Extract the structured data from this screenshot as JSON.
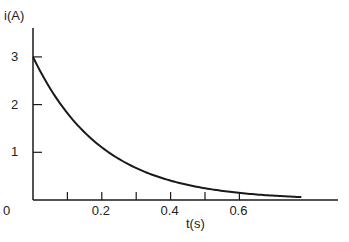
{
  "chart_data": {
    "type": "line",
    "title": "",
    "xlabel": "t(s)",
    "ylabel": "i(A)",
    "xlim": [
      0,
      0.9
    ],
    "ylim": [
      0,
      3.3
    ],
    "x_ticks": [
      0.1,
      0.2,
      0.3,
      0.4,
      0.5,
      0.6
    ],
    "x_tick_labels": [
      "0",
      "0.2",
      "0.4",
      "0.6"
    ],
    "x_tick_label_values": [
      0,
      0.2,
      0.4,
      0.6
    ],
    "y_ticks": [
      1,
      2,
      3
    ],
    "y_tick_labels": [
      "1",
      "2",
      "3"
    ],
    "grid": false,
    "legend": null,
    "series": [
      {
        "name": "i(t) = 3e^(-5t)",
        "x": [
          0,
          0.05,
          0.1,
          0.15,
          0.2,
          0.25,
          0.3,
          0.35,
          0.4,
          0.45,
          0.5,
          0.55,
          0.6,
          0.65,
          0.7,
          0.78
        ],
        "values": [
          3.0,
          2.34,
          1.82,
          1.42,
          1.1,
          0.86,
          0.67,
          0.52,
          0.41,
          0.32,
          0.25,
          0.19,
          0.15,
          0.12,
          0.09,
          0.06
        ]
      }
    ]
  },
  "layout": {
    "origin_px": [
      33,
      200
    ],
    "px_per_x_unit": 344,
    "px_per_y_unit": 47.7,
    "x_axis_end_px": 338,
    "y_axis_top_px": 28,
    "line_color": "#1a1a1a"
  }
}
